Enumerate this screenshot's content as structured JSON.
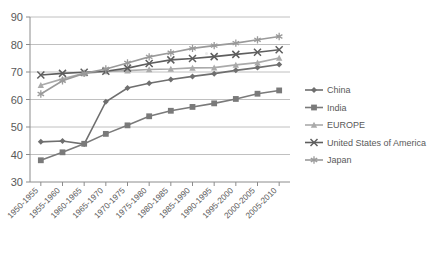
{
  "chart_data": {
    "type": "line",
    "title": "",
    "xlabel": "",
    "ylabel": "",
    "ylim": [
      30,
      90
    ],
    "yticks": [
      30,
      40,
      50,
      60,
      70,
      80,
      90
    ],
    "grid": true,
    "legend_position": "right",
    "categories": [
      "1950-1955",
      "1955-1960",
      "1960-1965",
      "1965-1970",
      "1970-1975",
      "1975-1980",
      "1980-1985",
      "1985-1990",
      "1990-1995",
      "1995-2000",
      "2000-2005",
      "2005-2010"
    ],
    "series": [
      {
        "name": "China",
        "marker": "diamond",
        "color": "#6f6f6f",
        "values": [
          44.6,
          44.9,
          43.8,
          59.2,
          64.2,
          65.9,
          67.3,
          68.4,
          69.4,
          70.6,
          71.6,
          72.7
        ]
      },
      {
        "name": "India",
        "marker": "square",
        "color": "#7a7a7a",
        "values": [
          37.9,
          40.8,
          43.9,
          47.5,
          50.6,
          53.9,
          55.9,
          57.3,
          58.6,
          60.2,
          62.1,
          63.3
        ]
      },
      {
        "name": "EUROPE",
        "marker": "triangle",
        "color": "#aaaaaa",
        "values": [
          65.2,
          67.5,
          69.5,
          70.2,
          70.5,
          70.9,
          71.1,
          71.5,
          71.6,
          72.6,
          73.4,
          75.1
        ]
      },
      {
        "name": "United States of America",
        "marker": "cross",
        "color": "#5e5e5e",
        "values": [
          68.9,
          69.5,
          69.9,
          70.3,
          71.4,
          73.1,
          74.4,
          74.9,
          75.6,
          76.4,
          77.2,
          78.1
        ]
      },
      {
        "name": "Japan",
        "marker": "asterisk",
        "color": "#9a9a9a",
        "values": [
          62.0,
          66.8,
          69.5,
          71.1,
          73.3,
          75.5,
          77.0,
          78.6,
          79.6,
          80.5,
          81.7,
          82.9
        ]
      }
    ]
  }
}
